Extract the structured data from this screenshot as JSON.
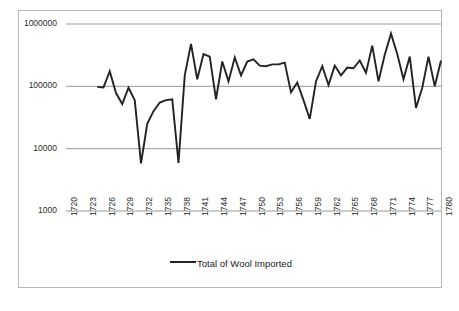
{
  "chart_data": {
    "type": "line",
    "title": "",
    "subtitle": "",
    "xlabel": "",
    "ylabel": "",
    "yscale": "log",
    "ylim": [
      1000,
      1000000
    ],
    "ytick_labels": [
      "1000000",
      "100000",
      "10000",
      "1000"
    ],
    "yticks": [
      1000000,
      100000,
      10000,
      1000
    ],
    "grid": true,
    "legend_position": "bottom",
    "xlim": [
      1720,
      1780
    ],
    "xtick_step": 3,
    "xtick_labels": [
      "1720",
      "1723",
      "1726",
      "1729",
      "1732",
      "1735",
      "1738",
      "1741",
      "1744",
      "1747",
      "1750",
      "1753",
      "1756",
      "1759",
      "1762",
      "1765",
      "1768",
      "1771",
      "1774",
      "1777",
      "1780"
    ],
    "series": [
      {
        "name": "Total of Wool Imported",
        "color": "#222222",
        "x": [
          1725,
          1726,
          1727,
          1728,
          1729,
          1730,
          1731,
          1732,
          1733,
          1734,
          1735,
          1736,
          1737,
          1738,
          1739,
          1740,
          1741,
          1742,
          1743,
          1744,
          1745,
          1746,
          1747,
          1748,
          1749,
          1750,
          1751,
          1752,
          1753,
          1754,
          1755,
          1756,
          1757,
          1758,
          1759,
          1760,
          1761,
          1762,
          1763,
          1764,
          1765,
          1766,
          1767,
          1768,
          1769,
          1770,
          1771,
          1772,
          1773,
          1774,
          1775,
          1776,
          1777,
          1778,
          1779,
          1780
        ],
        "values": [
          98000,
          96000,
          175000,
          78000,
          52000,
          95000,
          60000,
          5800,
          25000,
          40000,
          55000,
          60000,
          62000,
          5900,
          150000,
          480000,
          130000,
          330000,
          300000,
          62000,
          250000,
          120000,
          290000,
          150000,
          250000,
          270000,
          215000,
          210000,
          225000,
          225000,
          240000,
          80000,
          115000,
          60000,
          30000,
          120000,
          210000,
          105000,
          215000,
          150000,
          200000,
          195000,
          260000,
          165000,
          450000,
          120000,
          320000,
          700000,
          330000,
          130000,
          300000,
          45000,
          95000,
          300000,
          100000,
          260000
        ]
      }
    ]
  },
  "legend": {
    "label": "Total of Wool Imported"
  },
  "colors": {
    "line": "#222222",
    "grid": "#999999",
    "border": "#b8b8b8",
    "text": "#2b2b2b"
  }
}
